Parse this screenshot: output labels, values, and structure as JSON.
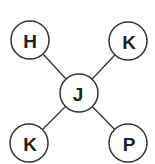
{
  "diagram": {
    "type": "graph",
    "nodes": [
      {
        "id": "n_h",
        "label": "H",
        "cx": 30,
        "cy": 40
      },
      {
        "id": "n_k_top",
        "label": "K",
        "cx": 128,
        "cy": 41
      },
      {
        "id": "n_j",
        "label": "J",
        "cx": 79,
        "cy": 93
      },
      {
        "id": "n_k_bottom",
        "label": "K",
        "cx": 29,
        "cy": 143
      },
      {
        "id": "n_p",
        "label": "P",
        "cx": 128,
        "cy": 143
      }
    ],
    "edges": [
      {
        "from": "n_j",
        "to": "n_h"
      },
      {
        "from": "n_j",
        "to": "n_k_top"
      },
      {
        "from": "n_j",
        "to": "n_k_bottom"
      },
      {
        "from": "n_j",
        "to": "n_p"
      }
    ],
    "radius": 19,
    "colors": {
      "stroke": "#333333",
      "text": "#222222",
      "fill": "#ffffff"
    }
  }
}
